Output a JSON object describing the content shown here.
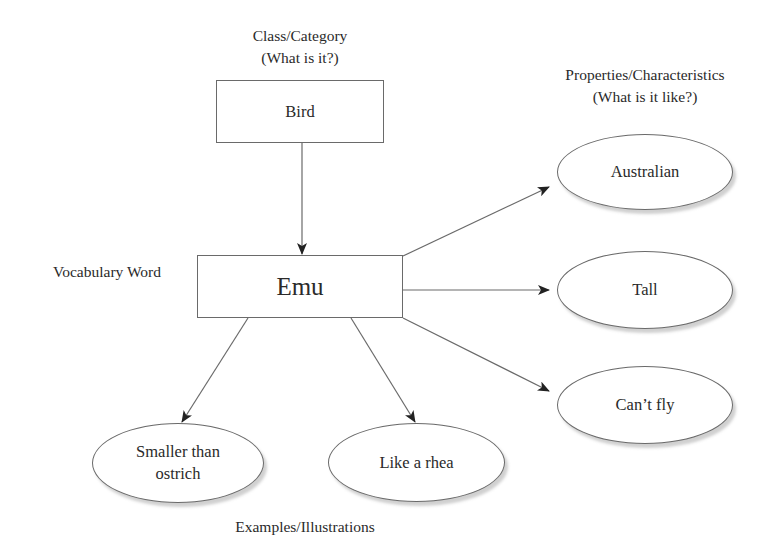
{
  "diagram": {
    "type": "concept-map",
    "labels": {
      "class_category": "Class/Category",
      "class_category_q": "(What is it?)",
      "properties": "Properties/Characteristics",
      "properties_q": "(What is it like?)",
      "vocabulary_word": "Vocabulary Word",
      "examples": "Examples/Illustrations"
    },
    "nodes": {
      "category": {
        "text": "Bird",
        "shape": "rectangle"
      },
      "word": {
        "text": "Emu",
        "shape": "rectangle"
      },
      "properties": [
        {
          "text": "Australian",
          "shape": "ellipse"
        },
        {
          "text": "Tall",
          "shape": "ellipse"
        },
        {
          "text": "Can’t fly",
          "shape": "ellipse"
        }
      ],
      "examples": [
        {
          "text": "Smaller than\nostrich",
          "line1": "Smaller than",
          "line2": "ostrich",
          "shape": "ellipse"
        },
        {
          "text": "Like a rhea",
          "shape": "ellipse"
        }
      ]
    },
    "edges": [
      {
        "from": "Bird",
        "to": "Emu"
      },
      {
        "from": "Emu",
        "to": "Australian"
      },
      {
        "from": "Emu",
        "to": "Tall"
      },
      {
        "from": "Emu",
        "to": "Can’t fly"
      },
      {
        "from": "Emu",
        "to": "Smaller than ostrich"
      },
      {
        "from": "Emu",
        "to": "Like a rhea"
      }
    ],
    "colors": {
      "stroke": "#6a6a6a",
      "text": "#2a2a2a",
      "background": "#ffffff"
    }
  }
}
